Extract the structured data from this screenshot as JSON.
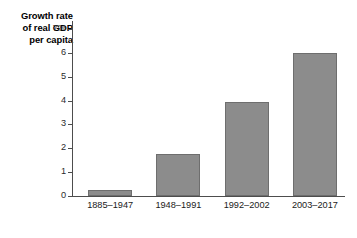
{
  "chart_data": {
    "type": "bar",
    "title": "Growth rate of real GDP per capita",
    "title_lines": [
      "Growth rate",
      "of real GDP",
      "per capita"
    ],
    "xlabel": "",
    "ylabel": "Growth rate of real GDP per capita",
    "categories": [
      "1885–1947",
      "1948–1991",
      "1992–2002",
      "2003–2017"
    ],
    "values": [
      0.27,
      1.75,
      3.92,
      6.0
    ],
    "ylim": [
      0,
      7
    ],
    "ytick_values": [
      0,
      1,
      2,
      3,
      4,
      5,
      6,
      7
    ],
    "ytick_labels": [
      "0",
      "1",
      "2",
      "3",
      "4",
      "5",
      "6",
      "7%"
    ],
    "unit": "%",
    "grid": false,
    "legend": false,
    "bar_color": "#8c8c8c",
    "bar_edge_color": "#6e6e6e",
    "axis_color": "#4d4d4d",
    "background": "#ffffff"
  }
}
